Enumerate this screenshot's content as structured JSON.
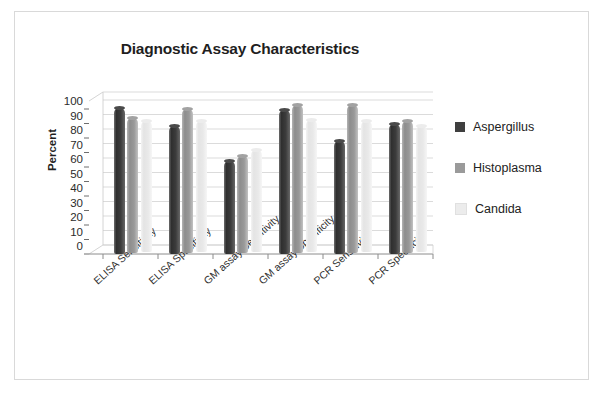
{
  "frame": {
    "border_color": "#d9d9d9"
  },
  "chart_data": {
    "type": "bar",
    "title": "Diagnostic Assay Characteristics",
    "xlabel": "",
    "ylabel": "Percent",
    "ylim": [
      0,
      100
    ],
    "yticks": [
      100,
      90,
      80,
      70,
      60,
      50,
      40,
      30,
      20,
      10,
      0
    ],
    "grid": true,
    "legend_position": "right",
    "categories": [
      "ELISA Sensitivity",
      "ELISA Specificity",
      "GM assay Sensitivity",
      "GM assay Specificity",
      "PCR Sensitivity",
      "PCR Specificity"
    ],
    "series": [
      {
        "name": "Aspergillus",
        "color": "#3f3f3f",
        "values": [
          101,
          88,
          64,
          99,
          78,
          90
        ]
      },
      {
        "name": "Histoplasma",
        "color": "#9a9a9a",
        "values": [
          93,
          99,
          67,
          102,
          102,
          91
        ]
      },
      {
        "name": "Candida",
        "color": "#ececec",
        "values": [
          90,
          90,
          70,
          91,
          90,
          87
        ]
      }
    ]
  }
}
